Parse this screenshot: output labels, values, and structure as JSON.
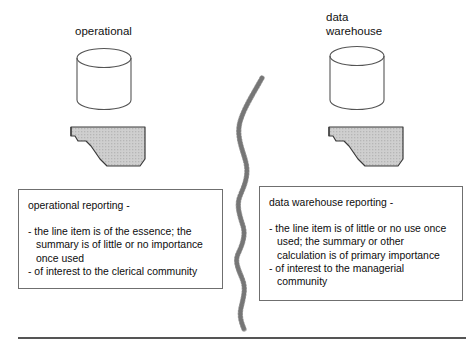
{
  "diagram": {
    "title_left": "operational",
    "title_right": "data\nwarehouse",
    "divider_style": "hand-drawn wavy hatched line",
    "colors": {
      "report_fill": "#c9c9c9",
      "report_stroke": "#3a3a3a",
      "cylinder_stroke": "#555555",
      "box_border": "#6f6f6f",
      "rule": "#555555",
      "text": "#0d0d0d"
    }
  },
  "left": {
    "caption": "operational",
    "database_icon": "cylinder-database-icon",
    "report_icon": "torn-report-sheet-icon",
    "box": {
      "title": "operational reporting -",
      "bullets": [
        "- the line item is of the essence; the summary is of little or no importance once used",
        "- of interest to the clerical community"
      ]
    }
  },
  "right": {
    "caption": "data\nwarehouse",
    "database_icon": "cylinder-database-icon",
    "report_icon": "torn-report-sheet-icon",
    "box": {
      "title": "data warehouse reporting -",
      "bullets": [
        "- the line item is of little or no use once used; the summary or other calculation is of primary importance",
        "- of interest to the managerial community"
      ]
    }
  }
}
